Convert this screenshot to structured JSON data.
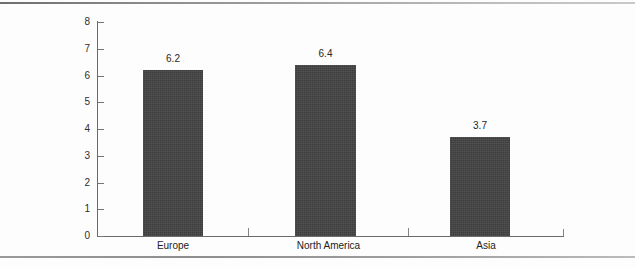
{
  "chart_data": {
    "type": "bar",
    "title": "",
    "subtitle": "",
    "xlabel": "",
    "ylabel": "",
    "categories": [
      "Europe",
      "North America",
      "Asia"
    ],
    "values": [
      6.2,
      6.4,
      3.7
    ],
    "value_labels": [
      "6.2",
      "6.4",
      "3.7"
    ],
    "ylim": [
      0,
      8
    ],
    "ytick_labels": [
      "8",
      "7",
      "6",
      "5",
      "4",
      "3",
      "2",
      "1",
      "0"
    ],
    "ytick_values": [
      8,
      7,
      6,
      5,
      4,
      3,
      2,
      1,
      0
    ],
    "grid": false,
    "legend": null,
    "legend_position": "none",
    "annotations": [],
    "series": [
      {
        "name": "",
        "values": [
          6.2,
          6.4,
          3.7
        ]
      }
    ]
  },
  "style": {
    "bar_color": "#434343",
    "axis_color": "#6b6b6b",
    "tick_color": "#757575",
    "text_color": "#222222",
    "background": "#fdfdfd",
    "rule_color": "#8a8a8a"
  }
}
